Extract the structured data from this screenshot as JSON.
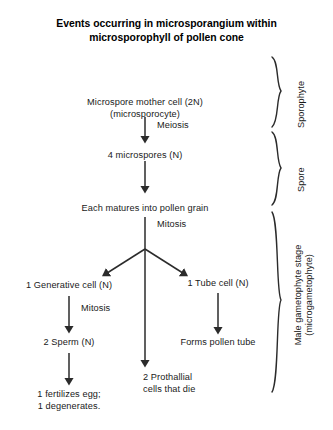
{
  "diagram": {
    "title": "Events occurring in microsporangium within\nmicrosporophyll of pollen cone",
    "nodes": {
      "mother_cell": "Microspore mother cell (2N)\n(microsporocyte)",
      "microspores": "4 microspores (N)",
      "pollen_grain": "Each matures into pollen grain",
      "generative_cell": "1 Generative cell (N)",
      "tube_cell": "1 Tube cell (N)",
      "sperm": "2 Sperm (N)",
      "pollen_tube": "Forms pollen tube",
      "prothallial": "2 Prothallial\ncells that die",
      "fertilizes": "1 fertilizes egg;\n1 degenerates."
    },
    "arrow_labels": {
      "meiosis": "Meiosis",
      "mitosis_upper": "Mitosis",
      "mitosis_lower": "Mitosis"
    },
    "brackets": {
      "sporophyte": "Sporophyte",
      "spore": "Spore",
      "gametophyte": "Male gametophyte stage\n(microgametophyte)"
    },
    "colors": {
      "background": "#ffffff",
      "text": "#1a1a1a",
      "title": "#000000",
      "stroke": "#2b2b2b"
    }
  }
}
